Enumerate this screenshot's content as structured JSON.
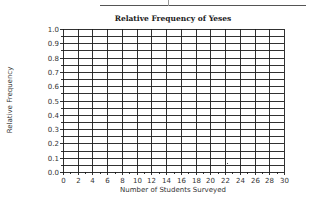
{
  "chart_data": {
    "type": "line",
    "title": "Relative Frequency of Yeses",
    "xlabel": "Number of Students Surveyed",
    "ylabel": "Relative Frequency",
    "xlim": [
      0,
      30
    ],
    "ylim": [
      0.0,
      1.0
    ],
    "x_ticks": [
      "0",
      "2",
      "4",
      "6",
      "8",
      "10",
      "12",
      "14",
      "16",
      "18",
      "20",
      "22",
      "24",
      "26",
      "28",
      "30"
    ],
    "y_ticks": [
      "0.0",
      "0.1",
      "0.2",
      "0.3",
      "0.4",
      "0.5",
      "0.6",
      "0.7",
      "0.8",
      "0.9",
      "1.0"
    ],
    "grid": true,
    "grid_x_step": 2,
    "grid_y_step": 0.05,
    "x_minor_tick_step": 1,
    "series": [],
    "legend": null
  },
  "colors": {
    "grid": "#1a1a1a",
    "text": "#333333",
    "background": "#ffffff"
  }
}
